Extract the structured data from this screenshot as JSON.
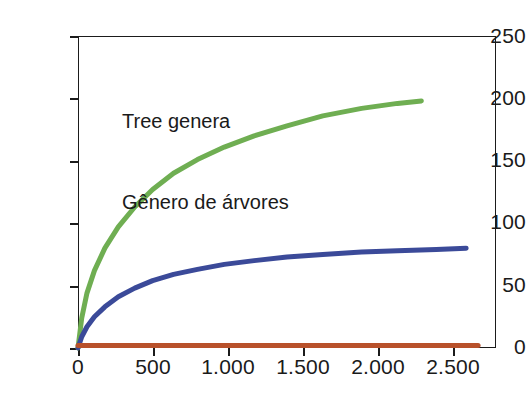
{
  "chart_data": {
    "type": "line",
    "title": "",
    "subtitle": "",
    "xlabel": "",
    "ylabel": "",
    "xlim": [
      0,
      2800
    ],
    "ylim": [
      0,
      250
    ],
    "grid": false,
    "legend_position": "none",
    "annotations": [
      {
        "text": "Tree genera",
        "x_px": 122,
        "y_px": 54
      },
      {
        "text": "Gênero de árvores",
        "x_px": 122,
        "y_px": 81
      }
    ],
    "x_ticks": [
      0,
      500,
      1000,
      1500,
      2000,
      2500
    ],
    "x_tick_labels": [
      "0",
      "500",
      "1.000",
      "1.500",
      "2.000",
      "2.500"
    ],
    "y_ticks": [
      0,
      50,
      100,
      150,
      200,
      250
    ],
    "y_tick_labels": [
      "0",
      "50",
      "100",
      "150",
      "200",
      "250"
    ],
    "series": [
      {
        "name": "green-curve",
        "color": "#6fae52",
        "line_width": 5,
        "x": [
          0,
          25,
          60,
          110,
          180,
          270,
          380,
          500,
          640,
          800,
          980,
          1180,
          1400,
          1640,
          1900,
          2140,
          2300
        ],
        "values": [
          0,
          24,
          44,
          62,
          80,
          97,
          113,
          127,
          140,
          151,
          161,
          170,
          178,
          186,
          192,
          196,
          198
        ]
      },
      {
        "name": "blue-curve",
        "color": "#3b4a99",
        "line_width": 5,
        "x": [
          0,
          25,
          60,
          110,
          180,
          270,
          380,
          500,
          640,
          800,
          980,
          1180,
          1400,
          1640,
          1900,
          2140,
          2400,
          2600
        ],
        "values": [
          0,
          9,
          17,
          25,
          33,
          41,
          48,
          54,
          59,
          63,
          67,
          70,
          73,
          75,
          77,
          78,
          79,
          80
        ]
      },
      {
        "name": "red-baseline",
        "color": "#b8512b",
        "line_width": 5,
        "x": [
          0,
          500,
          1000,
          1500,
          2000,
          2500,
          2680
        ],
        "values": [
          2,
          2,
          2,
          2,
          2,
          2,
          2
        ]
      }
    ],
    "colors": {
      "green": "#6fae52",
      "blue": "#3b4a99",
      "red": "#b8512b",
      "axis": "#1b1b1b",
      "text": "#1a1a1a",
      "background": "#ffffff"
    }
  }
}
